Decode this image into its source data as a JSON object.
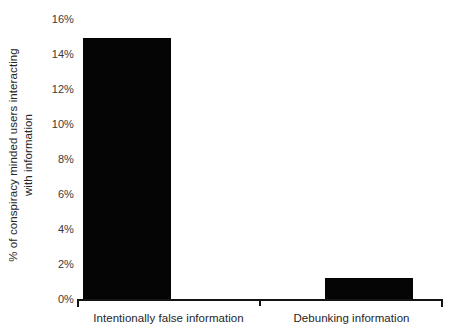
{
  "chart_data": {
    "type": "bar",
    "title": "",
    "subtitle": "",
    "xlabel": "",
    "ylabel": "% of conspiracy minded users interacting with information",
    "ylabel_lines": [
      "% of conspiracy minded users interacting",
      "with information"
    ],
    "categories": [
      "Intentionally false information",
      "Debunking information"
    ],
    "values": [
      15,
      1.25
    ],
    "value_labels": [
      "15%",
      "1.25%"
    ],
    "ylim": [
      0,
      16
    ],
    "ytick_values": [
      0,
      2,
      4,
      6,
      8,
      10,
      12,
      14,
      16
    ],
    "ytick_labels": [
      "0%",
      "2%",
      "4%",
      "6%",
      "8%",
      "10%",
      "12%",
      "14%",
      "16%"
    ],
    "grid": false,
    "legend": false,
    "legend_position": "none",
    "bar_color": "#050505",
    "axis_color": "#141414",
    "text_color": "#262626",
    "background_color": "#ffffff"
  }
}
